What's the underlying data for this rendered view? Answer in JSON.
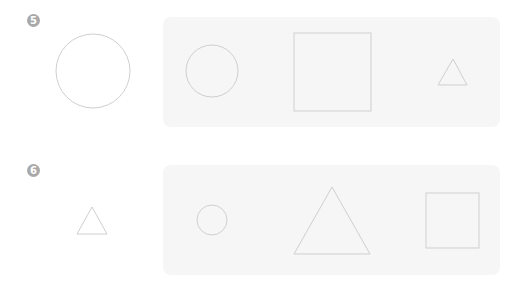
{
  "problems": [
    {
      "number": "5",
      "reference_shape": "circle",
      "options": [
        "circle",
        "square",
        "triangle"
      ]
    },
    {
      "number": "6",
      "reference_shape": "triangle",
      "options": [
        "circle",
        "triangle",
        "square"
      ]
    }
  ],
  "colors": {
    "badge": "#a9a9a9",
    "panel": "#f6f6f6",
    "stroke": "#cfcfcf"
  }
}
